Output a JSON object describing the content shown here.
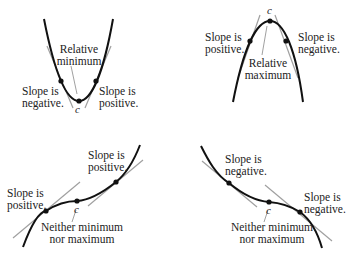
{
  "colors": {
    "curve": "#111111",
    "tangent": "#a0a0a0",
    "text": "#222222"
  },
  "panels": [
    {
      "type": "relative-minimum",
      "point_label": "c",
      "center_label": [
        "Relative",
        "minimum"
      ],
      "left_label": [
        "Slope is",
        "negative."
      ],
      "right_label": [
        "Slope is",
        "positive."
      ]
    },
    {
      "type": "relative-maximum",
      "point_label": "c",
      "center_label": [
        "Relative",
        "maximum"
      ],
      "left_label": [
        "Slope is",
        "positive."
      ],
      "right_label": [
        "Slope is",
        "negative."
      ]
    },
    {
      "type": "increasing-inflection",
      "point_label": "c",
      "center_label": [
        "Neither minimum",
        "nor maximum"
      ],
      "left_label": [
        "Slope is",
        "positive."
      ],
      "right_label": [
        "Slope is",
        "positive."
      ]
    },
    {
      "type": "decreasing-inflection",
      "point_label": "c",
      "center_label": [
        "Neither minimum",
        "nor maximum"
      ],
      "left_label": [
        "Slope is",
        "negative."
      ],
      "right_label": [
        "Slope is",
        "negative."
      ]
    }
  ]
}
